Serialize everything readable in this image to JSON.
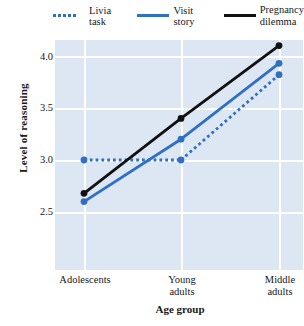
{
  "chart_data": {
    "type": "line",
    "title": "",
    "xlabel": "Age group",
    "ylabel": "Level of reasoning",
    "categories": [
      "Adolescents",
      "Young\nadults",
      "Middle\nadults"
    ],
    "ytick_labels": [
      "2.5",
      "3.0",
      "3.5",
      "4.0"
    ],
    "ytick_values": [
      2.5,
      3.0,
      3.5,
      4.0
    ],
    "ylim": [
      2.3,
      4.25
    ],
    "grid": true,
    "legend_position": "top",
    "series": [
      {
        "name": "Livia task",
        "values": [
          3.0,
          3.0,
          3.82
        ],
        "color": "#2f6fc4",
        "style": "dotted",
        "marker": "circle"
      },
      {
        "name": "Visit story",
        "values": [
          2.6,
          3.2,
          3.93
        ],
        "color": "#2f6fc4",
        "style": "solid",
        "marker": "circle"
      },
      {
        "name": "Pregnancy\ndilemma",
        "values": [
          2.68,
          3.4,
          4.1
        ],
        "color": "#111111",
        "style": "solid",
        "marker": "circle"
      }
    ]
  },
  "legend": {
    "items": [
      {
        "label": "Livia task"
      },
      {
        "label": "Visit story"
      },
      {
        "label": "Pregnancy\ndilemma"
      }
    ]
  },
  "axes": {
    "y_title": "Level of reasoning",
    "x_title": "Age group",
    "y_ticks": [
      "4.0",
      "3.5",
      "3.0",
      "2.5"
    ],
    "x_ticks": [
      "Adolescents",
      "Young\nadults",
      "Middle\nadults"
    ]
  },
  "colors": {
    "plot_background": "#dde7f3",
    "gridline": "#ffffff",
    "blue_series": "#2f6fc4",
    "black_series": "#111111",
    "page_background": "#ffffff"
  }
}
